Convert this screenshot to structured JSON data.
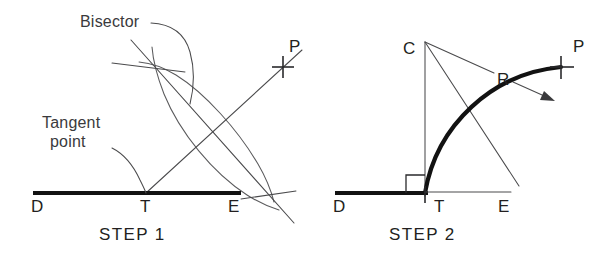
{
  "figure": {
    "background_color": "#ffffff",
    "line_color": "#4a4a4c",
    "heavy_line_color": "#121212",
    "text_color": "#231f20"
  },
  "step1": {
    "caption": "STEP  1",
    "annotations": {
      "bisector": "Bisector",
      "tangent_line1": "Tangent",
      "tangent_line2": "point"
    },
    "points": {
      "D": "D",
      "T": "T",
      "E": "E",
      "P": "P"
    },
    "geometry": {
      "baseline": {
        "x1": 33,
        "y1": 193,
        "x2": 241,
        "y2": 193
      },
      "tangent_point": {
        "x": 146,
        "y": 193
      },
      "point_P": {
        "x": 283,
        "y": 67
      },
      "arc_intersection_upper": {
        "x": 158,
        "y": 67
      },
      "arc_intersection_lower": {
        "x": 268,
        "y": 195
      },
      "arc_radius": 131,
      "bisector_line": {
        "x1": 131,
        "y1": 40,
        "x2": 292,
        "y2": 222
      },
      "line_TP": {
        "x1": 146,
        "y1": 193,
        "x2": 300,
        "y2": 52
      }
    }
  },
  "step2": {
    "caption": "STEP  2",
    "annotations": {
      "radius": "R"
    },
    "points": {
      "C": "C",
      "D": "D",
      "T": "T",
      "E": "E",
      "P": "P"
    },
    "geometry": {
      "center_C": {
        "x": 425,
        "y": 42
      },
      "tangent_point_T": {
        "x": 425,
        "y": 193
      },
      "point_P": {
        "x": 561,
        "y": 67
      },
      "radius": 152,
      "baseline_heavy": {
        "x1": 335,
        "y1": 193,
        "x2": 425,
        "y2": 193
      },
      "baseline_thin": {
        "x1": 425,
        "y1": 192,
        "x2": 511,
        "y2": 192
      },
      "right_angle_square": {
        "x": 406,
        "y": 175,
        "size": 19
      },
      "radius_leader_from": {
        "x": 425,
        "y": 42
      },
      "radius_leader_to": {
        "x": 553,
        "y": 100
      }
    }
  }
}
